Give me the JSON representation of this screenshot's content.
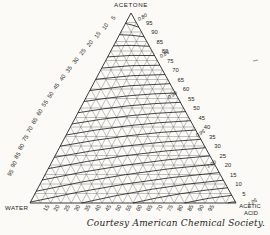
{
  "figure": {
    "caption": "Courtesy American Chemical Society.",
    "background": "#fbfaf6",
    "ink": "#262626"
  },
  "chart_data": {
    "type": "ternary",
    "title": "",
    "components": {
      "top": "ACETONE",
      "bottom_left": "WATER",
      "bottom_right_line1": "ACETIC",
      "bottom_right_line2": "ACID"
    },
    "axes": {
      "grid_interval_percent": 5,
      "left_tick_values": [
        5,
        10,
        15,
        20,
        25,
        30,
        35,
        40,
        45,
        50,
        55,
        60,
        65,
        70,
        75,
        80,
        85,
        90,
        95
      ],
      "right_tick_values": [
        95,
        90,
        85,
        80,
        75,
        70,
        65,
        60,
        55,
        50,
        45,
        40,
        35,
        30,
        25,
        20,
        15,
        10,
        5
      ],
      "bottom_tick_values": [
        15,
        20,
        25,
        30,
        35,
        40,
        45,
        50,
        55,
        60,
        65,
        70,
        75,
        80,
        85,
        90,
        95
      ]
    },
    "contours": {
      "property": "specific gravity isolines",
      "labels": [
        "0.80",
        "0.85",
        "0.90",
        "0.95",
        "1.00",
        "1.05"
      ],
      "curves": [
        {
          "sg": 0.8,
          "start_edge": "left",
          "start_pct": 94.5,
          "end_pct": 92.5,
          "label": "0.80",
          "label_x": 139,
          "label_y": 21
        },
        {
          "sg": 0.8125,
          "start_edge": "left",
          "start_pct": 88.6,
          "end_pct": 87.5
        },
        {
          "sg": 0.825,
          "start_edge": "left",
          "start_pct": 82.7,
          "end_pct": 82.5
        },
        {
          "sg": 0.8375,
          "start_edge": "left",
          "start_pct": 76.9,
          "end_pct": 77.6
        },
        {
          "sg": 0.85,
          "start_edge": "left",
          "start_pct": 71.0,
          "end_pct": 72.5,
          "label": "0.85",
          "label_x": 161,
          "label_y": 58
        },
        {
          "sg": 0.8625,
          "start_edge": "left",
          "start_pct": 65.1,
          "end_pct": 67.6
        },
        {
          "sg": 0.875,
          "start_edge": "left",
          "start_pct": 59.2,
          "end_pct": 62.8
        },
        {
          "sg": 0.8875,
          "start_edge": "left",
          "start_pct": 53.4,
          "end_pct": 57.9
        },
        {
          "sg": 0.9,
          "start_edge": "left",
          "start_pct": 47.5,
          "end_pct": 53.0,
          "label": "0.90",
          "label_x": 169,
          "label_y": 99
        },
        {
          "sg": 0.9125,
          "start_edge": "left",
          "start_pct": 41.6,
          "end_pct": 48.1
        },
        {
          "sg": 0.925,
          "start_edge": "left",
          "start_pct": 35.8,
          "end_pct": 43.3
        },
        {
          "sg": 0.9375,
          "start_edge": "left",
          "start_pct": 29.9,
          "end_pct": 38.4
        },
        {
          "sg": 0.95,
          "start_edge": "left",
          "start_pct": 24.0,
          "end_pct": 33.5,
          "label": "0.95",
          "label_x": 197,
          "label_y": 137
        },
        {
          "sg": 0.9625,
          "start_edge": "left",
          "start_pct": 18.1,
          "end_pct": 29.1
        },
        {
          "sg": 0.975,
          "start_edge": "left",
          "start_pct": 12.1,
          "end_pct": 24.8
        },
        {
          "sg": 0.9875,
          "start_edge": "left",
          "start_pct": 6.2,
          "end_pct": 20.4
        },
        {
          "sg": 1.0,
          "start_edge": "left",
          "start_pct": 0.5,
          "end_pct": 16.0,
          "label": "1.00",
          "label_x": 208,
          "label_y": 168
        },
        {
          "sg": 1.0125,
          "start_edge": "bottom",
          "start_pct": 25,
          "end_pct": 12.0
        },
        {
          "sg": 1.025,
          "start_edge": "bottom",
          "start_pct": 50,
          "end_pct": 8.0
        },
        {
          "sg": 1.0375,
          "start_edge": "bottom",
          "start_pct": 75,
          "end_pct": 4.0
        },
        {
          "sg": 1.05,
          "start_edge": "bottom",
          "start_pct": 96,
          "end_pct": 0.6,
          "label": "1.05",
          "label_x": 249,
          "label_y": 206
        }
      ]
    },
    "caption": "Courtesy American Chemical Society.",
    "layout": {
      "apex": [
        131,
        13
      ],
      "bottom_left": [
        30,
        203
      ],
      "bottom_right": [
        236,
        203
      ],
      "left_label_anchors": [
        [
          115,
          19
        ],
        [
          52,
          96
        ],
        [
          12,
          174
        ]
      ],
      "grid_color": "#555555",
      "contour_color": "#1a1a1a"
    }
  }
}
